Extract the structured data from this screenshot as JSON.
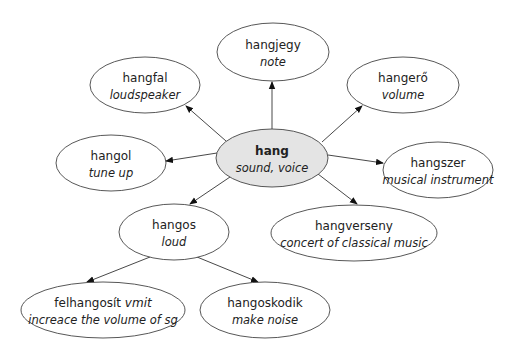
{
  "diagram": {
    "type": "word-family-map",
    "colors": {
      "center_fill": "#e4e4e4",
      "node_fill": "#ffffff",
      "stroke": "#444444"
    },
    "center": {
      "id": "hang",
      "word": "hang",
      "gloss": "sound, voice",
      "cx": 272,
      "cy": 158,
      "rx": 56,
      "ry": 29
    },
    "nodes": [
      {
        "id": "hangjegy",
        "word": "hangjegy",
        "gloss": "note",
        "cx": 273,
        "cy": 52,
        "rx": 56,
        "ry": 29
      },
      {
        "id": "hangfal",
        "word": "hangfal",
        "gloss": "loudspeaker",
        "cx": 145,
        "cy": 85,
        "rx": 55,
        "ry": 28
      },
      {
        "id": "hangero",
        "word": "hangerő",
        "gloss": "volume",
        "cx": 403,
        "cy": 85,
        "rx": 56,
        "ry": 28
      },
      {
        "id": "hangol",
        "word": "hangol",
        "gloss": "tune up",
        "cx": 111,
        "cy": 163,
        "rx": 55,
        "ry": 28
      },
      {
        "id": "hangszer",
        "word": "hangszer",
        "gloss": "musical instrument",
        "cx": 438,
        "cy": 170,
        "rx": 55,
        "ry": 28
      },
      {
        "id": "hangos",
        "word": "hangos",
        "gloss": "loud",
        "cx": 174,
        "cy": 232,
        "rx": 55,
        "ry": 28
      },
      {
        "id": "hangverseny",
        "word": "hangverseny",
        "gloss": "concert of classical music",
        "cx": 354,
        "cy": 233,
        "rx": 83,
        "ry": 28
      },
      {
        "id": "felhangosit",
        "word": "felhangosít",
        "word_suffix": "vmit",
        "gloss": "increace the volume of sg",
        "cx": 103,
        "cy": 310,
        "rx": 82,
        "ry": 28
      },
      {
        "id": "hangoskodik",
        "word": "hangoskodik",
        "gloss": "make noise",
        "cx": 265,
        "cy": 310,
        "rx": 65,
        "ry": 28
      }
    ],
    "edges": [
      {
        "from": "hang",
        "to": "hangjegy",
        "x1": 272,
        "y1": 129,
        "x2": 272,
        "y2": 82
      },
      {
        "from": "hang",
        "to": "hangfal",
        "x1": 226,
        "y1": 141,
        "x2": 186,
        "y2": 106
      },
      {
        "from": "hang",
        "to": "hangero",
        "x1": 322,
        "y1": 142,
        "x2": 362,
        "y2": 106
      },
      {
        "from": "hang",
        "to": "hangol",
        "x1": 217,
        "y1": 153,
        "x2": 166,
        "y2": 161
      },
      {
        "from": "hang",
        "to": "hangszer",
        "x1": 328,
        "y1": 155,
        "x2": 383,
        "y2": 163
      },
      {
        "from": "hang",
        "to": "hangos",
        "x1": 230,
        "y1": 177,
        "x2": 190,
        "y2": 204
      },
      {
        "from": "hang",
        "to": "hangverseny",
        "x1": 318,
        "y1": 174,
        "x2": 357,
        "y2": 204
      },
      {
        "from": "hangos",
        "to": "felhangosit",
        "x1": 150,
        "y1": 257,
        "x2": 87,
        "y2": 282
      },
      {
        "from": "hangos",
        "to": "hangoskodik",
        "x1": 197,
        "y1": 257,
        "x2": 258,
        "y2": 282
      }
    ]
  }
}
